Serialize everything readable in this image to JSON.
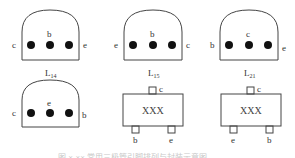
{
  "figure": {
    "packages": [
      {
        "id": "to92-1",
        "type": "TO-92",
        "caption_main": "L",
        "caption_sub": "14",
        "pins": {
          "left": "c",
          "top": "b",
          "right": "e"
        }
      },
      {
        "id": "to92-2",
        "type": "TO-92",
        "caption_main": "L",
        "caption_sub": "15",
        "pins": {
          "left": "e",
          "top": "b",
          "right": "c"
        }
      },
      {
        "id": "to92-3",
        "type": "TO-92",
        "caption_main": "L",
        "caption_sub": "21",
        "pins": {
          "left": "b",
          "top": "c",
          "right": "e"
        }
      },
      {
        "id": "to92-4",
        "type": "TO-92",
        "caption_main": "",
        "caption_sub": "",
        "pins": {
          "left": "c",
          "top": "e",
          "right": "b"
        }
      },
      {
        "id": "sot23-1",
        "type": "SOT-23",
        "marking": "XXX",
        "pins": {
          "top": "c",
          "bottom_left": "b",
          "bottom_right": "e"
        }
      },
      {
        "id": "sot23-2",
        "type": "SOT-23",
        "marking": "XXX",
        "pins": {
          "top": "c",
          "bottom_left": "e",
          "bottom_right": "b"
        }
      }
    ],
    "caption_partial": "图 ×-×× 常用三极管引脚排列与封装示意图"
  }
}
